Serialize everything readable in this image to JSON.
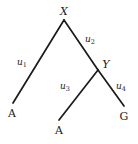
{
  "figure": {
    "background_color": "#ffffff",
    "line_color": "#1a1a1a",
    "text_color": "#1a1a1a",
    "width": 138,
    "height": 144
  },
  "nodes": {
    "root": {
      "label": "X",
      "x": 64,
      "y": 20,
      "label_x": 64,
      "label_y": 11
    },
    "internal": {
      "label": "Y",
      "x": 98,
      "y": 70,
      "label_x": 106,
      "label_y": 64
    }
  },
  "leaves": [
    {
      "id": "leaf-left",
      "label": "A",
      "x": 13,
      "y": 103,
      "label_x": 12,
      "label_y": 113
    },
    {
      "id": "leaf-middle",
      "label": "A",
      "x": 59,
      "y": 120,
      "label_x": 59,
      "label_y": 130
    },
    {
      "id": "leaf-right",
      "label": "G",
      "x": 124,
      "y": 106,
      "label_x": 124,
      "label_y": 116
    }
  ],
  "branches": [
    {
      "id": "branch-u1",
      "label": "u",
      "subscript": "1",
      "from": "X",
      "to": "A (left)",
      "x1": 64,
      "y1": 20,
      "x2": 13,
      "y2": 103,
      "label_x": 22,
      "label_y": 63
    },
    {
      "id": "branch-u2",
      "label": "u",
      "subscript": "2",
      "from": "X",
      "to": "Y",
      "x1": 64,
      "y1": 20,
      "x2": 98,
      "y2": 70,
      "label_x": 90,
      "label_y": 40
    },
    {
      "id": "branch-u3",
      "label": "u",
      "subscript": "3",
      "from": "Y",
      "to": "A (middle)",
      "x1": 98,
      "y1": 70,
      "x2": 59,
      "y2": 120,
      "label_x": 65,
      "label_y": 87
    },
    {
      "id": "branch-u4",
      "label": "u",
      "subscript": "4",
      "from": "Y",
      "to": "G",
      "x1": 98,
      "y1": 70,
      "x2": 124,
      "y2": 106,
      "label_x": 121,
      "label_y": 87
    }
  ]
}
